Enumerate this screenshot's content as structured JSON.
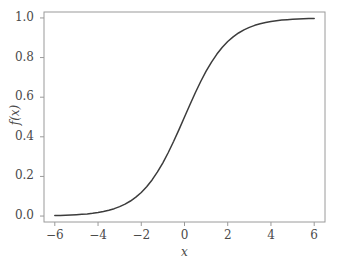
{
  "chart_data": {
    "type": "line",
    "title": "",
    "xlabel": "x",
    "ylabel": "f(x)",
    "xlim": [
      -6.5,
      6.5
    ],
    "ylim": [
      -0.03,
      1.03
    ],
    "grid": false,
    "legend": false,
    "line_color": "#3c3c3c",
    "frame_color": "#9a9a9a",
    "xticks": [
      -6,
      -4,
      -2,
      0,
      2,
      4,
      6
    ],
    "xtick_labels": [
      "−6",
      "−4",
      "−2",
      "0",
      "2",
      "4",
      "6"
    ],
    "yticks": [
      0.0,
      0.2,
      0.4,
      0.6,
      0.8,
      1.0
    ],
    "ytick_labels": [
      "0.0",
      "0.2",
      "0.4",
      "0.6",
      "0.8",
      "1.0"
    ],
    "series": [
      {
        "name": "f(x) = 1/(1+e^-x)",
        "x": [
          -6.0,
          -5.75,
          -5.5,
          -5.25,
          -5.0,
          -4.75,
          -4.5,
          -4.25,
          -4.0,
          -3.75,
          -3.5,
          -3.25,
          -3.0,
          -2.75,
          -2.5,
          -2.25,
          -2.0,
          -1.75,
          -1.5,
          -1.25,
          -1.0,
          -0.75,
          -0.5,
          -0.25,
          0.0,
          0.25,
          0.5,
          0.75,
          1.0,
          1.25,
          1.5,
          1.75,
          2.0,
          2.25,
          2.5,
          2.75,
          3.0,
          3.25,
          3.5,
          3.75,
          4.0,
          4.25,
          4.5,
          4.75,
          5.0,
          5.25,
          5.5,
          5.75,
          6.0
        ],
        "y": [
          0.0025,
          0.0032,
          0.0041,
          0.0052,
          0.0067,
          0.0086,
          0.011,
          0.0141,
          0.018,
          0.023,
          0.0293,
          0.0373,
          0.0474,
          0.0601,
          0.0759,
          0.0953,
          0.1192,
          0.148,
          0.1824,
          0.2227,
          0.2689,
          0.3208,
          0.3775,
          0.4378,
          0.5,
          0.5622,
          0.6225,
          0.6792,
          0.7311,
          0.7773,
          0.8176,
          0.852,
          0.8808,
          0.9047,
          0.9241,
          0.9399,
          0.9526,
          0.9627,
          0.9707,
          0.977,
          0.982,
          0.9859,
          0.989,
          0.9914,
          0.9933,
          0.9948,
          0.9959,
          0.9968,
          0.9975
        ]
      }
    ]
  },
  "axes": {
    "xlabel": "x",
    "ylabel": "f(x)"
  }
}
